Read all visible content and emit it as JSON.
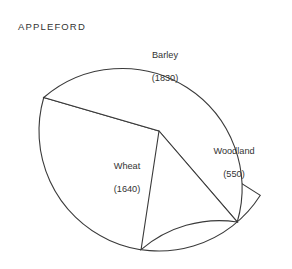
{
  "chart_data": {
    "type": "pie",
    "title": "APPLEFORD",
    "categories": [
      "Barley",
      "Wheat",
      "Woodland"
    ],
    "values": [
      1830,
      1640,
      550
    ],
    "total": 4020,
    "value_labels": [
      "(1830)",
      "(1640)",
      "(550)"
    ],
    "units": "",
    "legend": "none",
    "grid": false,
    "slices": [
      {
        "name": "Barley",
        "value": 1830,
        "value_label": "(1830)",
        "percent": 45.5,
        "start_angle_deg": 163.8,
        "end_angle_deg": 360.0,
        "sweep_deg": 196.2,
        "fill": "#ffffff",
        "stroke": "#3a3a3a"
      },
      {
        "name": "Wheat",
        "value": 1640,
        "value_label": "(1640)",
        "percent": 40.8,
        "start_angle_deg": 310.7,
        "end_angle_deg": 163.8,
        "sweep_deg": 146.9,
        "fill": "#ffffff",
        "stroke": "#3a3a3a"
      },
      {
        "name": "Woodland",
        "value": 550,
        "value_label": "(550)",
        "percent": 13.7,
        "start_angle_deg": 310.7,
        "end_angle_deg": 360.0,
        "sweep_deg": 49.3,
        "fill": "#ffffff",
        "stroke": "#3a3a3a"
      }
    ],
    "geometry": {
      "center_x": 159,
      "center_y": 131,
      "radius": 120
    }
  },
  "figure": {
    "title": "APPLEFORD",
    "background": "#ffffff",
    "line_color": "#3a3a3a",
    "text_color": "#333333"
  },
  "labels": {
    "barley": {
      "name": "Barley",
      "value": "(1830)"
    },
    "wheat": {
      "name": "Wheat",
      "value": "(1640)"
    },
    "woodland": {
      "name": "Woodland",
      "value": "(550)"
    }
  }
}
